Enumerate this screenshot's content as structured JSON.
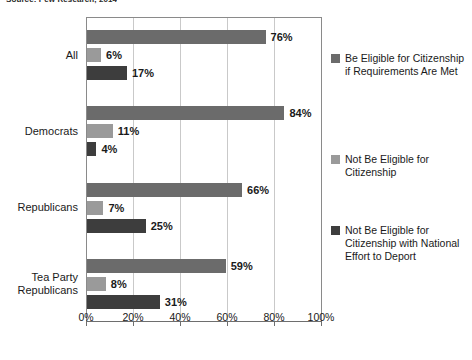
{
  "source_note": "Source: Pew Research, 2014",
  "chart_data": {
    "type": "bar",
    "orientation": "horizontal",
    "title": "",
    "subtitle": "",
    "xlabel": "",
    "ylabel": "",
    "xlim": [
      0,
      100
    ],
    "xticks": [
      "0%",
      "20%",
      "40%",
      "60%",
      "80%",
      "100%"
    ],
    "xtick_values": [
      0,
      20,
      40,
      60,
      80,
      100
    ],
    "grid": true,
    "legend_position": "right",
    "categories": [
      "All",
      "Democrats",
      "Republicans",
      "Tea Party\nRepublicans"
    ],
    "series": [
      {
        "name": "Be Eligible for Citizenship if Requirements Are Met",
        "color": "#6b6b6b",
        "values": [
          76,
          84,
          66,
          59
        ],
        "labels": [
          "76%",
          "84%",
          "66%",
          "59%"
        ]
      },
      {
        "name": "Not Be Eligible for Citizenship",
        "color": "#9a9a9a",
        "values": [
          6,
          11,
          7,
          8
        ],
        "labels": [
          "6%",
          "11%",
          "7%",
          "8%"
        ]
      },
      {
        "name": "Not Be Eligible for Citizenship with National Effort to Deport",
        "color": "#3d3d3d",
        "values": [
          17,
          4,
          25,
          31
        ],
        "labels": [
          "17%",
          "4%",
          "25%",
          "31%"
        ]
      }
    ]
  },
  "legend": {
    "items": [
      {
        "label": "Be Eligible for Citizenship if Requirements Are Met",
        "color": "#6b6b6b"
      },
      {
        "label": "Not Be Eligible for Citizenship",
        "color": "#9a9a9a"
      },
      {
        "label": "Not Be Eligible for Citizenship with National Effort to Deport",
        "color": "#3d3d3d"
      }
    ]
  }
}
